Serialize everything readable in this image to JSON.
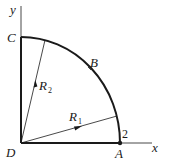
{
  "diagram": {
    "axes": {
      "x_label": "x",
      "y_label": "y"
    },
    "points": {
      "C": "C",
      "B": "B",
      "D": "D",
      "A": "A"
    },
    "vectors": {
      "R1": {
        "symbol": "R",
        "subscript": "1"
      },
      "R2": {
        "symbol": "R",
        "subscript": "2"
      }
    },
    "marker_label": "2",
    "colors": {
      "line": "#1a1a1a",
      "background": "#ffffff"
    }
  }
}
